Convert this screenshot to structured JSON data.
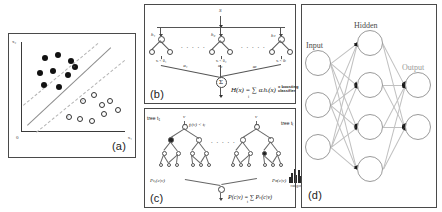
{
  "figure": {
    "caption_tags": {
      "a": "(a)",
      "b": "(b)",
      "c": "(c)",
      "d": "(d)"
    },
    "background": "#ffffff",
    "ink": "#1a1a1a"
  },
  "panel_a": {
    "name": "support-vector-machine",
    "tag": "(a)",
    "axis": {
      "y_label": "x₂",
      "x_label": "x₁",
      "origin_label": "0"
    },
    "class_filled_label": "class +1",
    "class_open_label": "class -1",
    "margin_label": "margin",
    "hyperplane_label": "decision boundary",
    "support_vector_marks": [
      "×",
      "×",
      "×"
    ],
    "chart_data": {
      "type": "scatter",
      "title": "",
      "xlabel": "x₁",
      "ylabel": "x₂",
      "xlim": [
        0,
        100
      ],
      "ylim": [
        0,
        100
      ],
      "grid": false,
      "legend": "none",
      "series": [
        {
          "name": "class +1",
          "marker": "filled-circle",
          "color": "#111111",
          "points": [
            [
              23,
              82
            ],
            [
              36,
              86
            ],
            [
              48,
              79
            ],
            [
              18,
              66
            ],
            [
              31,
              68
            ],
            [
              45,
              63
            ],
            [
              22,
              52
            ],
            [
              37,
              50
            ],
            [
              52,
              72
            ]
          ]
        },
        {
          "name": "class -1",
          "marker": "open-circle",
          "color": "#333333",
          "points": [
            [
              60,
              35
            ],
            [
              70,
              41
            ],
            [
              78,
              30
            ],
            [
              86,
              34
            ],
            [
              93,
              25
            ],
            [
              46,
              17
            ],
            [
              57,
              14
            ],
            [
              68,
              12
            ],
            [
              80,
              20
            ]
          ]
        }
      ],
      "lines": [
        {
          "name": "decision boundary",
          "style": "solid",
          "color": "#8d8d8d",
          "from": [
            6,
            8
          ],
          "to": [
            86,
            94
          ]
        },
        {
          "name": "upper margin",
          "style": "dashed",
          "color": "#b4b4b4",
          "from": [
            2,
            30
          ],
          "to": [
            74,
            99
          ]
        },
        {
          "name": "lower margin",
          "style": "dashed",
          "color": "#b4b4b4",
          "from": [
            14,
            0
          ],
          "to": [
            99,
            80
          ]
        }
      ]
    }
  },
  "panel_b": {
    "name": "boosting-ensemble",
    "tag": "(b)",
    "root_label": "S",
    "weak_learners": [
      {
        "label": "h₁",
        "weight": "α₁",
        "sub": "xᵢ < θ₁"
      },
      {
        "label": "h₂",
        "weight": "α₂",
        "sub": "xᵢ < θ₂"
      },
      {
        "label": "hₜ",
        "weight": "αₜ",
        "sub": "xᵢ < θₜ"
      }
    ],
    "ellipsis": "∙ ∙ ∙ ∙ ∙",
    "sum_symbol": "Σ",
    "equation": "H(x) = ∑ αᵢhᵢ(x)",
    "equation_sub": "i",
    "equation_note": "= boosting\nclassifier",
    "equation_note_line1": "= boosting",
    "equation_note_line2": "classifier"
  },
  "panel_c": {
    "name": "random-forest",
    "tag": "(c)",
    "input_symbol": "v",
    "tree_left_label": "tree t₁",
    "tree_left_split": "fⱼ(v) < tⱼ",
    "tree_right_label": "tree tₜ",
    "ellipsis": "∙ ∙ ∙ ∙ ∙",
    "leaf_dist_left": "Pₜ₁(c|v)",
    "leaf_dist_right": "Pₜₜ(c|v)",
    "histogram_caption": "category c",
    "histogram_left_bars": [
      3,
      6,
      9,
      5,
      8,
      4,
      2
    ],
    "histogram_right_bars": [
      4,
      7,
      10,
      6,
      9,
      5,
      3
    ],
    "equation": "P(c|v) = ∑ Pₜ(c|v)",
    "equation_sub": "t"
  },
  "panel_d": {
    "name": "neural-network",
    "tag": "(d)",
    "layers": [
      {
        "name": "Input",
        "label": "Input",
        "nodes": 3
      },
      {
        "name": "Hidden",
        "label": "Hidden",
        "nodes": 4
      },
      {
        "name": "Output",
        "label": "Output",
        "nodes": 2
      }
    ],
    "node_color": "#ffffff",
    "node_stroke": "#9a9a9a",
    "edge_color": "#c0c0c0",
    "arrow_color": "#1a1a1a"
  }
}
